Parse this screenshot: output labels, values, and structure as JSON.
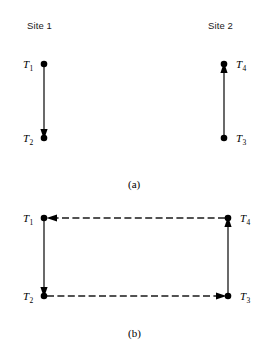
{
  "figure": {
    "width": 267,
    "height": 352,
    "background": "#ffffff",
    "stroke_color": "#1a1a1a",
    "node_color": "#000000"
  },
  "panel_a": {
    "caption": "(a)",
    "caption_x": 128,
    "caption_y": 178,
    "site_labels": [
      {
        "text": "Site 1",
        "x": 27,
        "y": 20
      },
      {
        "text": "Site 2",
        "x": 208,
        "y": 20
      }
    ],
    "nodes": [
      {
        "id": "T1",
        "label": "T",
        "sub": "1",
        "cx": 44,
        "cy": 64,
        "r": 3.2,
        "label_x": 23,
        "label_y": 58,
        "label_side": "left"
      },
      {
        "id": "T2",
        "label": "T",
        "sub": "2",
        "cx": 44,
        "cy": 138,
        "r": 3.2,
        "label_x": 23,
        "label_y": 132,
        "label_side": "left"
      },
      {
        "id": "T4",
        "label": "T",
        "sub": "4",
        "cx": 224,
        "cy": 64,
        "r": 3.2,
        "label_x": 236,
        "label_y": 58,
        "label_side": "right"
      },
      {
        "id": "T3",
        "label": "T",
        "sub": "3",
        "cx": 224,
        "cy": 138,
        "r": 3.2,
        "label_x": 236,
        "label_y": 132,
        "label_side": "right"
      }
    ],
    "edges": [
      {
        "from": "T1",
        "to": "T2",
        "x1": 44,
        "y1": 67,
        "x2": 44,
        "y2": 136,
        "style": "solid",
        "arrow": "end",
        "direction": "down"
      },
      {
        "from": "T3",
        "to": "T4",
        "x1": 224,
        "y1": 135,
        "x2": 224,
        "y2": 67,
        "style": "solid",
        "arrow": "end",
        "direction": "up"
      }
    ]
  },
  "panel_b": {
    "caption": "(b)",
    "caption_x": 128,
    "caption_y": 327,
    "nodes": [
      {
        "id": "T1",
        "label": "T",
        "sub": "1",
        "cx": 44,
        "cy": 218,
        "r": 3.2,
        "label_x": 23,
        "label_y": 212,
        "label_side": "left"
      },
      {
        "id": "T2",
        "label": "T",
        "sub": "2",
        "cx": 44,
        "cy": 296,
        "r": 3.2,
        "label_x": 23,
        "label_y": 290,
        "label_side": "left"
      },
      {
        "id": "T4",
        "label": "T",
        "sub": "4",
        "cx": 228,
        "cy": 218,
        "r": 3.2,
        "label_x": 240,
        "label_y": 212,
        "label_side": "right"
      },
      {
        "id": "T3",
        "label": "T",
        "sub": "3",
        "cx": 228,
        "cy": 296,
        "r": 3.2,
        "label_x": 240,
        "label_y": 290,
        "label_side": "right"
      }
    ],
    "edges": [
      {
        "from": "T1",
        "to": "T2",
        "x1": 44,
        "y1": 221,
        "x2": 44,
        "y2": 294,
        "style": "solid",
        "arrow": "end",
        "direction": "down"
      },
      {
        "from": "T3",
        "to": "T4",
        "x1": 228,
        "y1": 293,
        "x2": 228,
        "y2": 221,
        "style": "solid",
        "arrow": "end",
        "direction": "up"
      },
      {
        "from": "T4",
        "to": "T1",
        "x1": 225,
        "y1": 218,
        "x2": 49,
        "y2": 218,
        "style": "dashed",
        "arrow": "end",
        "direction": "left"
      },
      {
        "from": "T2",
        "to": "T3",
        "x1": 47,
        "y1": 296,
        "x2": 224,
        "y2": 296,
        "style": "dashed",
        "arrow": "end",
        "direction": "right"
      }
    ]
  }
}
